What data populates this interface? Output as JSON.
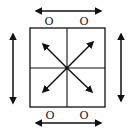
{
  "diagram": {
    "stroke_color": "#111111",
    "background": "#ffffff",
    "labels": {
      "top_left": "O",
      "top_right": "O",
      "bottom_left": "O",
      "bottom_right": "O"
    },
    "arrows": {
      "top": "horizontal double-headed",
      "bottom": "horizontal double-headed",
      "left": "vertical double-headed",
      "right": "vertical double-headed",
      "center": "four diagonal arrows radiating from center"
    }
  }
}
